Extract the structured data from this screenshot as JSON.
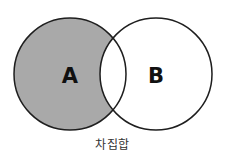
{
  "diagram": {
    "type": "venn",
    "operation": "difference",
    "sets": [
      {
        "id": "A",
        "label": "A",
        "highlighted": true
      },
      {
        "id": "B",
        "label": "B",
        "highlighted": false
      }
    ],
    "highlighted_region": "A - B",
    "caption": "차집합"
  },
  "colors": {
    "highlight_fill": "#a9a9a9",
    "background_fill": "#ffffff",
    "stroke": "#1e1e1e",
    "label_text": "#111111",
    "caption_text": "#333333"
  }
}
